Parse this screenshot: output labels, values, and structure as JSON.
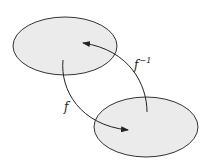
{
  "diagram": {
    "type": "function-mapping",
    "sets": [
      {
        "id": "domain",
        "position": "top-left"
      },
      {
        "id": "codomain",
        "position": "bottom-right"
      }
    ],
    "arrows": [
      {
        "id": "f",
        "from": "domain",
        "to": "codomain",
        "label": "f",
        "label_sup": ""
      },
      {
        "id": "f-inverse",
        "from": "codomain",
        "to": "domain",
        "label": "f",
        "label_sup": "−1"
      }
    ],
    "colors": {
      "fill": "#ebebeb",
      "stroke": "#333333"
    }
  }
}
